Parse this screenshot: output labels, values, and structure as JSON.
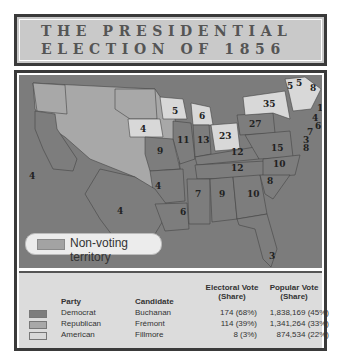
{
  "title": {
    "line1": "THE PRESIDENTIAL",
    "line2": "ELECTION OF 1856"
  },
  "colors": {
    "democrat": "#7d7d7d",
    "republican": "#a8a8a8",
    "american": "#d8d8d8",
    "non_voting": "#a3a3a3",
    "water": "#7c7c7c"
  },
  "legend": {
    "non_voting_label": "Non-voting territory"
  },
  "map_labels": [
    {
      "state": "CA",
      "votes": "4",
      "x": 24,
      "y": 114
    },
    {
      "state": "TX",
      "votes": "4",
      "x": 108,
      "y": 145
    },
    {
      "state": "WI",
      "votes": "5",
      "x": 175,
      "y": 94
    },
    {
      "state": "IA",
      "votes": "4",
      "x": 138,
      "y": 111
    },
    {
      "state": "MI",
      "votes": "6",
      "x": 200,
      "y": 97
    },
    {
      "state": "IL",
      "votes": "11",
      "x": 180,
      "y": 116
    },
    {
      "state": "IN",
      "votes": "13",
      "x": 198,
      "y": 117
    },
    {
      "state": "OH",
      "votes": "23",
      "x": 223,
      "y": 118
    },
    {
      "state": "PA",
      "votes": "27",
      "x": 244,
      "y": 106
    },
    {
      "state": "NY",
      "votes": "35",
      "x": 259,
      "y": 86
    },
    {
      "state": "VT",
      "votes": "5",
      "x": 281,
      "y": 66
    },
    {
      "state": "NH",
      "votes": "5",
      "x": 291,
      "y": 62
    },
    {
      "state": "ME",
      "votes": "8",
      "x": 308,
      "y": 66
    },
    {
      "state": "MA",
      "votes": "13",
      "x": 318,
      "y": 93
    },
    {
      "state": "RI",
      "votes": "4",
      "x": 312,
      "y": 102
    },
    {
      "state": "CT",
      "votes": "6",
      "x": 314,
      "y": 110
    },
    {
      "state": "NJ",
      "votes": "7",
      "x": 304,
      "y": 116
    },
    {
      "state": "DE",
      "votes": "3",
      "x": 298,
      "y": 124
    },
    {
      "state": "MD",
      "votes": "8",
      "x": 298,
      "y": 131
    },
    {
      "state": "MO",
      "votes": "9",
      "x": 148,
      "y": 133
    },
    {
      "state": "KY",
      "votes": "12",
      "x": 234,
      "y": 137
    },
    {
      "state": "VA",
      "votes": "15",
      "x": 262,
      "y": 132
    },
    {
      "state": "TN",
      "votes": "12",
      "x": 228,
      "y": 153
    },
    {
      "state": "NC",
      "votes": "10",
      "x": 270,
      "y": 150
    },
    {
      "state": "AR",
      "votes": "4",
      "x": 145,
      "y": 177
    },
    {
      "state": "SC",
      "votes": "8",
      "x": 260,
      "y": 172
    },
    {
      "state": "MS",
      "votes": "7",
      "x": 212,
      "y": 184
    },
    {
      "state": "AL",
      "votes": "9",
      "x": 228,
      "y": 183
    },
    {
      "state": "GA",
      "votes": "10",
      "x": 248,
      "y": 186
    },
    {
      "state": "LA",
      "votes": "6",
      "x": 194,
      "y": 203
    },
    {
      "state": "FL",
      "votes": "3",
      "x": 264,
      "y": 245
    }
  ],
  "table": {
    "headers": {
      "party": "Party",
      "candidate": "Candidate",
      "electoral": "Electoral Vote",
      "electoral_sub": "(Share)",
      "popular": "Popular Vote",
      "popular_sub": "(Share)"
    },
    "rows": [
      {
        "party": "Democrat",
        "candidate": "Buchanan",
        "electoral": "174 (68%)",
        "popular": "1,838,169 (45%)"
      },
      {
        "party": "Republican",
        "candidate": "Frémont",
        "electoral": "114 (39%)",
        "popular": "1,341,264 (33%)"
      },
      {
        "party": "American",
        "candidate": "Fillmore",
        "electoral": "8 (3%)",
        "popular": "874,534 (22%)"
      }
    ]
  }
}
